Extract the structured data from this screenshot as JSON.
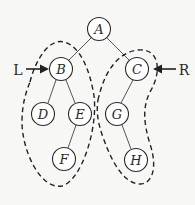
{
  "diagram": {
    "type": "binary-tree",
    "nodes": {
      "A": {
        "label": "A",
        "x": 99,
        "y": 29
      },
      "B": {
        "label": "B",
        "x": 61,
        "y": 69
      },
      "C": {
        "label": "C",
        "x": 137,
        "y": 69
      },
      "D": {
        "label": "D",
        "x": 43,
        "y": 114
      },
      "E": {
        "label": "E",
        "x": 80,
        "y": 114
      },
      "F": {
        "label": "F",
        "x": 64,
        "y": 159
      },
      "G": {
        "label": "G",
        "x": 117,
        "y": 114
      },
      "H": {
        "label": "H",
        "x": 136,
        "y": 160
      }
    },
    "edges": [
      [
        "A",
        "B"
      ],
      [
        "A",
        "C"
      ],
      [
        "B",
        "D"
      ],
      [
        "B",
        "E"
      ],
      [
        "E",
        "F"
      ],
      [
        "C",
        "G"
      ],
      [
        "G",
        "H"
      ]
    ],
    "groups": {
      "left": {
        "label": "L",
        "members": [
          "B",
          "D",
          "E",
          "F"
        ],
        "style": "dashed"
      },
      "right": {
        "label": "R",
        "members": [
          "C",
          "G",
          "H"
        ],
        "style": "dashed"
      }
    },
    "pointers": {
      "left": {
        "label": "L",
        "points_to": "B"
      },
      "right": {
        "label": "R",
        "points_to": "C"
      }
    }
  }
}
